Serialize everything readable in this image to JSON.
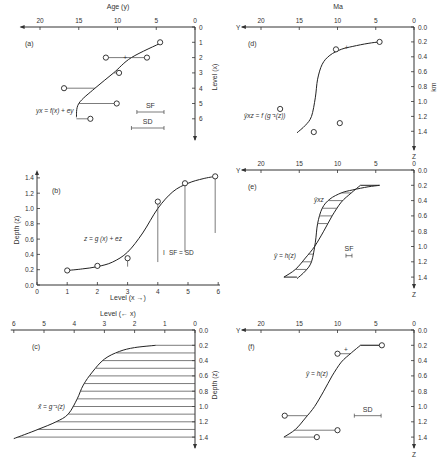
{
  "chart_data": [
    {
      "id": "a",
      "type": "scatter",
      "panel_label": "(a)",
      "title": "",
      "xlabel": "Age (y)",
      "ylabel": "Level (x)",
      "x_ticks": [
        "20",
        "15",
        "10",
        "5",
        "0"
      ],
      "x_tick_values": [
        20,
        15,
        10,
        5,
        0
      ],
      "y_ticks": [
        "0",
        "1",
        "2",
        "3",
        "4",
        "5",
        "6"
      ],
      "y_tick_values": [
        0,
        1,
        2,
        3,
        4,
        5,
        6
      ],
      "xlim": [
        0,
        22
      ],
      "ylim": [
        0,
        6.8
      ],
      "x_reversed": true,
      "curve_label": "yx = f(x) + ey",
      "curve": {
        "x": [
          1,
          2,
          3,
          4,
          5,
          5.9
        ],
        "y": [
          4.2,
          8.2,
          10.5,
          12.9,
          15.0,
          15.3
        ]
      },
      "points": [
        {
          "level": 1,
          "age": 4.5
        },
        {
          "level": 2,
          "age": 11.5
        },
        {
          "level": 2,
          "age": 6.2
        },
        {
          "level": 3,
          "age": 9.8
        },
        {
          "level": 4,
          "age": 16.9
        },
        {
          "level": 5,
          "age": 10.1
        },
        {
          "level": 6,
          "age": 13.5
        }
      ],
      "plus_marker": {
        "level": 2,
        "age": 9.0
      },
      "scale_bars": [
        {
          "label": "SF",
          "length_years": 3.5
        },
        {
          "label": "SD",
          "length_years": 4.2
        }
      ]
    },
    {
      "id": "b",
      "type": "scatter",
      "panel_label": "(b)",
      "xlabel": "Level (x →)",
      "ylabel": "Depth (z)",
      "x_ticks": [
        "0",
        "1",
        "2",
        "3",
        "4",
        "5",
        "6"
      ],
      "x_tick_values": [
        0,
        1,
        2,
        3,
        4,
        5,
        6
      ],
      "y_ticks": [
        "0.0",
        "0.2",
        "0.4",
        "0.6",
        "0.8",
        "1.0",
        "1.2",
        "1.4"
      ],
      "y_tick_values": [
        0,
        0.2,
        0.4,
        0.6,
        0.8,
        1.0,
        1.2,
        1.4
      ],
      "xlim": [
        0,
        6
      ],
      "ylim": [
        0,
        1.45
      ],
      "curve_label": "z = g (x) + ez",
      "curve": {
        "x": [
          1,
          1.5,
          2,
          2.5,
          3,
          3.5,
          4,
          4.5,
          5,
          5.5,
          5.9
        ],
        "y": [
          0.19,
          0.21,
          0.24,
          0.3,
          0.43,
          0.68,
          1.0,
          1.22,
          1.33,
          1.39,
          1.42
        ]
      },
      "points": [
        {
          "level": 1,
          "depth": 0.19
        },
        {
          "level": 2,
          "depth": 0.25
        },
        {
          "level": 3,
          "depth": 0.35
        },
        {
          "level": 4,
          "depth": 1.09
        },
        {
          "level": 4.9,
          "depth": 1.33
        },
        {
          "level": 5.9,
          "depth": 1.42
        }
      ],
      "legend_text": "SF = SD"
    },
    {
      "id": "c",
      "type": "line",
      "panel_label": "(c)",
      "xlabel": "Level (← x)",
      "ylabel": "Depth (z)",
      "x_ticks": [
        "6",
        "5",
        "4",
        "3",
        "2",
        "1",
        "0"
      ],
      "x_tick_values": [
        6,
        5,
        4,
        3,
        2,
        1,
        0
      ],
      "y_ticks": [
        "0.0",
        "0.2",
        "0.4",
        "0.6",
        "0.8",
        "1.0",
        "1.2",
        "1.4"
      ],
      "y_tick_values": [
        0,
        0.2,
        0.4,
        0.6,
        0.8,
        1.0,
        1.2,
        1.4
      ],
      "x_reversed": true,
      "curve_label": "x̂ = g⁻¹(z)",
      "curve": {
        "x": [
          1.3,
          2,
          2.5,
          3,
          3.4,
          3.7,
          3.9,
          4.2,
          4.6,
          5.2,
          6.0
        ],
        "depth": [
          0.2,
          0.23,
          0.28,
          0.38,
          0.55,
          0.72,
          0.9,
          1.1,
          1.2,
          1.3,
          1.42
        ]
      },
      "hatch_depths": [
        0.2,
        0.3,
        0.4,
        0.5,
        0.6,
        0.7,
        0.8,
        0.9,
        1.0,
        1.1,
        1.2,
        1.3,
        1.4
      ]
    },
    {
      "id": "d",
      "type": "scatter",
      "panel_label": "(d)",
      "xlabel": "Ma",
      "ylabel": "km",
      "x_axis_name": "Y",
      "z_axis_name": "Z",
      "x_ticks": [
        "20",
        "15",
        "10",
        "5",
        "0"
      ],
      "x_tick_values": [
        20,
        15,
        10,
        5,
        0
      ],
      "y_ticks": [
        "0.0",
        "0.2",
        "0.4",
        "0.6",
        "0.8",
        "1.0",
        "1.2",
        "1.4"
      ],
      "y_tick_values": [
        0,
        0.2,
        0.4,
        0.6,
        0.8,
        1.0,
        1.2,
        1.4
      ],
      "x_reversed": true,
      "curve_label": "ŷxz = f (g⁻¹(z))",
      "curve": {
        "age": [
          4.5,
          6,
          8,
          9.5,
          11,
          12,
          12.6,
          12.9,
          13.4,
          14.2,
          15.3
        ],
        "depth": [
          0.2,
          0.22,
          0.26,
          0.3,
          0.38,
          0.5,
          0.7,
          0.95,
          1.2,
          1.32,
          1.42
        ]
      },
      "points": [
        {
          "age": 4.5,
          "depth": 0.2
        },
        {
          "age": 10.2,
          "depth": 0.3
        },
        {
          "age": 17.5,
          "depth": 1.1
        },
        {
          "age": 13.1,
          "depth": 1.41
        },
        {
          "age": 9.7,
          "depth": 1.29
        }
      ],
      "plus_marker": {
        "age": 8.8,
        "depth": 0.27
      }
    },
    {
      "id": "e",
      "type": "area",
      "panel_label": "(e)",
      "x_axis_name": "Y",
      "z_axis_name": "Z",
      "x_ticks": [
        "20",
        "15",
        "10",
        "5",
        "0"
      ],
      "x_tick_values": [
        20,
        15,
        10,
        5,
        0
      ],
      "y_ticks": [
        "0.0",
        "0.2",
        "0.4",
        "0.6",
        "0.8",
        "1.0",
        "1.2",
        "1.4"
      ],
      "y_tick_values": [
        0,
        0.2,
        0.4,
        0.6,
        0.8,
        1.0,
        1.2,
        1.4
      ],
      "x_reversed": true,
      "series": [
        {
          "name": "ŷxz",
          "age": [
            4.5,
            6,
            8,
            9.5,
            11,
            12,
            12.6,
            12.9,
            13.4,
            14.2,
            15.3
          ],
          "depth": [
            0.2,
            0.22,
            0.26,
            0.3,
            0.38,
            0.5,
            0.7,
            0.95,
            1.2,
            1.32,
            1.42
          ]
        },
        {
          "name": "ŷ = h(z)",
          "age": [
            7,
            8.2,
            9.5,
            10.7,
            11.8,
            13,
            14.2,
            15.5,
            17
          ],
          "depth": [
            0.2,
            0.3,
            0.42,
            0.6,
            0.8,
            1.0,
            1.15,
            1.3,
            1.4
          ]
        }
      ],
      "hatch_depths": [
        0.3,
        0.4,
        0.5,
        0.6,
        0.7,
        1.0,
        1.1,
        1.2,
        1.3
      ],
      "scale_bar": {
        "label": "SF",
        "length_years": 0.8
      }
    },
    {
      "id": "f",
      "type": "scatter",
      "panel_label": "(f)",
      "x_axis_name": "Y",
      "z_axis_name": "Z",
      "x_ticks": [
        "20",
        "15",
        "10",
        "5",
        "0"
      ],
      "x_tick_values": [
        20,
        15,
        10,
        5,
        0
      ],
      "y_ticks": [
        "0.0",
        "0.2",
        "0.4",
        "0.6",
        "0.8",
        "1.0",
        "1.2",
        "1.4"
      ],
      "y_tick_values": [
        0,
        0.2,
        0.4,
        0.6,
        0.8,
        1.0,
        1.2,
        1.4
      ],
      "x_reversed": true,
      "curve_label": "ŷ = h(z)",
      "curve": {
        "age": [
          7,
          8.2,
          9.5,
          10.7,
          11.8,
          13,
          14.2,
          15.5,
          17
        ],
        "depth": [
          0.2,
          0.3,
          0.42,
          0.6,
          0.8,
          1.0,
          1.15,
          1.3,
          1.4
        ]
      },
      "points": [
        {
          "age": 4.2,
          "depth": 0.2
        },
        {
          "age": 10.0,
          "depth": 0.31
        },
        {
          "age": 16.9,
          "depth": 1.12
        },
        {
          "age": 10.0,
          "depth": 1.31
        },
        {
          "age": 12.7,
          "depth": 1.4
        }
      ],
      "plus_marker": {
        "age": 8.9,
        "depth": 0.25
      },
      "scale_bar": {
        "label": "SD",
        "length_years": 3.5
      }
    }
  ]
}
